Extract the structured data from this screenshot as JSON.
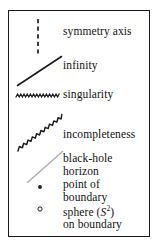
{
  "figure": {
    "kind": "legend-box",
    "border_color": "#1a1a1a",
    "background": "#ffffff"
  },
  "entries": [
    {
      "id": "symmetry-axis",
      "symbol": "dashed-vertical-line-icon",
      "symbol_color": "#1a1a1a",
      "label": "symmetry axis",
      "lines": [
        "symmetry axis"
      ]
    },
    {
      "id": "infinity",
      "symbol": "solid-diagonal-line-icon",
      "symbol_color": "#1a1a1a",
      "label": "infinity",
      "lines": [
        "infinity"
      ]
    },
    {
      "id": "singularity",
      "symbol": "horizontal-zigzag-line-icon",
      "symbol_color": "#1a1a1a",
      "label": "singularity",
      "lines": [
        "singularity"
      ]
    },
    {
      "id": "incompleteness",
      "symbol": "diagonal-zigzag-line-icon",
      "symbol_color": "#1a1a1a",
      "label": "incompleteness",
      "lines": [
        "incompleteness"
      ]
    },
    {
      "id": "black-hole-horizon",
      "symbol": "gray-diagonal-line-icon",
      "symbol_color": "#b0b0b0",
      "label": "black-hole horizon",
      "lines": [
        "black-hole",
        "horizon"
      ]
    },
    {
      "id": "point-of-boundary",
      "symbol": "filled-dot-icon",
      "symbol_color": "#1a1a1a",
      "label": "point of boundary",
      "lines": [
        "point of",
        "boundary"
      ]
    },
    {
      "id": "sphere-on-boundary",
      "symbol": "open-circle-icon",
      "symbol_color": "#1a1a1a",
      "label": "sphere (S2) on boundary",
      "lines": [
        "sphere (S²)",
        "on boundary"
      ],
      "math_prefix": "sphere (",
      "math_symbol": "S",
      "math_superscript": "2",
      "math_suffix": ")",
      "second_line": "on boundary"
    }
  ]
}
